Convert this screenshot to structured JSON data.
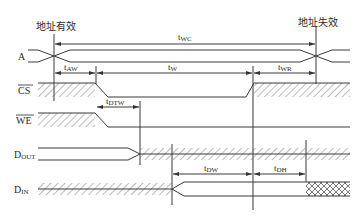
{
  "diagram": {
    "type": "timing-diagram",
    "annotations": {
      "address_valid": "地址有效",
      "address_invalid": "地址失效"
    },
    "signals": [
      {
        "name": "A",
        "sub": "",
        "overline": false
      },
      {
        "name": "CS",
        "sub": "",
        "overline": true
      },
      {
        "name": "WE",
        "sub": "",
        "overline": true
      },
      {
        "name": "D",
        "sub": "OUT",
        "overline": false
      },
      {
        "name": "D",
        "sub": "IN",
        "overline": false
      }
    ],
    "timings": [
      {
        "id": "tWC",
        "t": "t",
        "sub": "WC"
      },
      {
        "id": "tAW",
        "t": "t",
        "sub": "AW"
      },
      {
        "id": "tW",
        "t": "t",
        "sub": "W"
      },
      {
        "id": "tWR",
        "t": "t",
        "sub": "WR"
      },
      {
        "id": "tDTW",
        "t": "t",
        "sub": "DTW"
      },
      {
        "id": "tDW",
        "t": "t",
        "sub": "DW"
      },
      {
        "id": "tDH",
        "t": "t",
        "sub": "DH"
      }
    ],
    "colors": {
      "line": "#3a3a3a",
      "hatch": "#6a6a6a",
      "background": "#ffffff"
    }
  }
}
